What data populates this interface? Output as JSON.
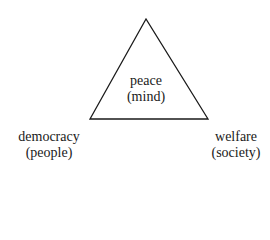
{
  "diagram": {
    "shape": "triangle",
    "vertices": {
      "top": {
        "label": "peace",
        "sublabel": "(mind)"
      },
      "bottom_left": {
        "label": "democracy",
        "sublabel": "(people)"
      },
      "bottom_right": {
        "label": "welfare",
        "sublabel": "(society)"
      }
    },
    "colors": {
      "stroke": "#1a1a1a",
      "background": "#ffffff"
    }
  }
}
